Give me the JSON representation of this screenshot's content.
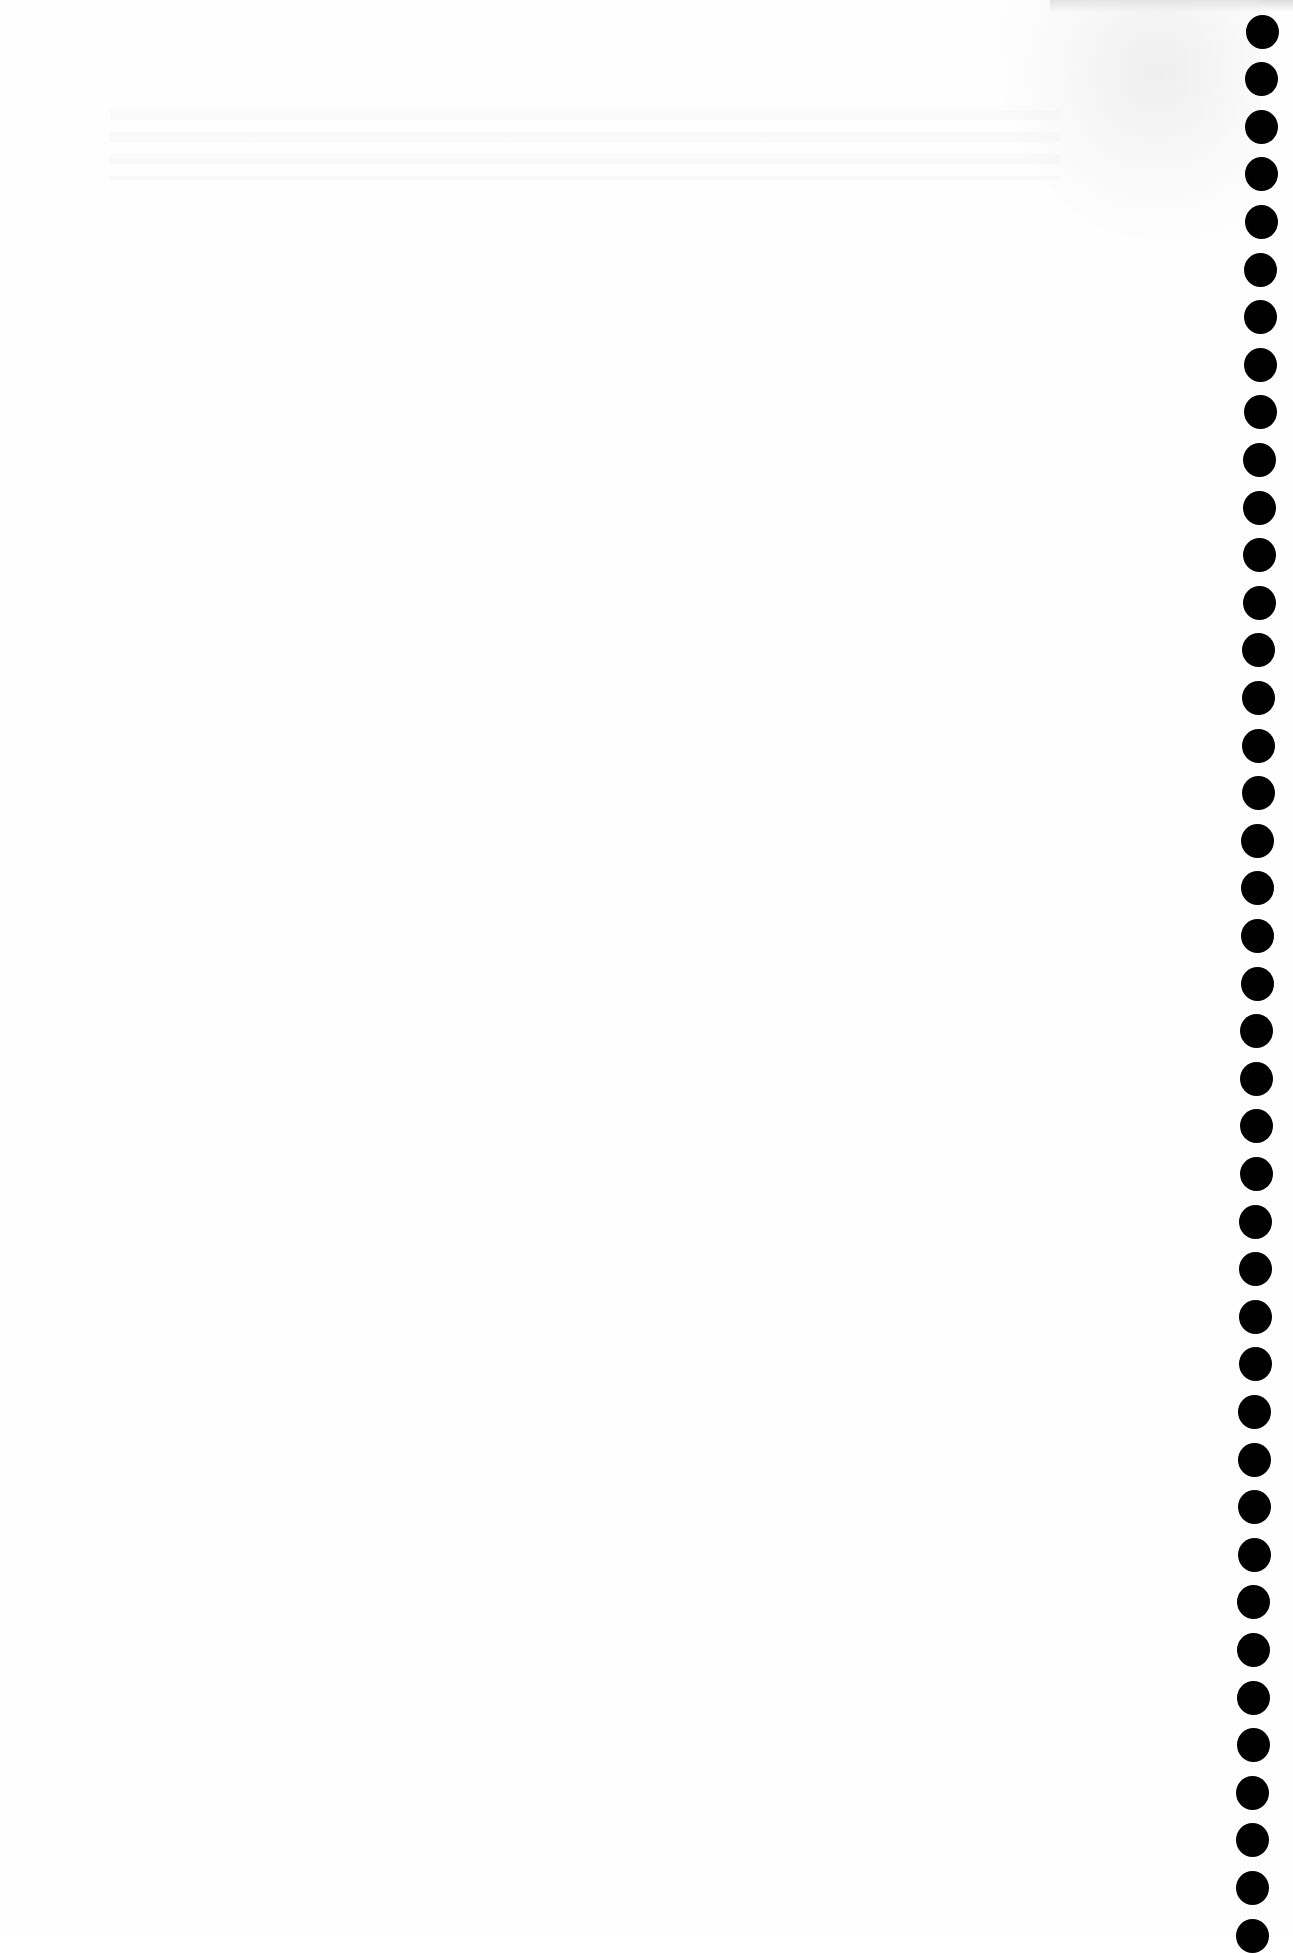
{
  "document": {
    "type": "scanned-blank-page",
    "content_text": "",
    "background_color": "#fefefe",
    "binding": {
      "side": "right",
      "hole_count": 41,
      "hole_color": "#000000",
      "hole_center_x": 1262,
      "first_hole_center_y": 31,
      "hole_spacing_px": 47.6,
      "hole_diameter_px": 33
    },
    "artifacts": [
      {
        "name": "water-stain",
        "position": "top-right"
      },
      {
        "name": "bleed-through-text",
        "position": "top",
        "legible": false
      }
    ]
  }
}
